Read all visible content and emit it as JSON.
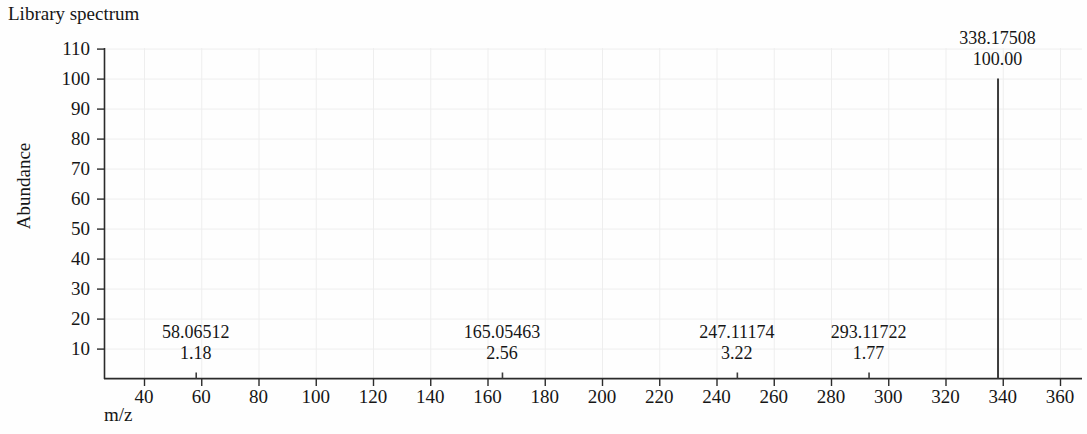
{
  "chart_title": "Library spectrum",
  "axes": {
    "y_label": "Abundance",
    "x_label": "m/z",
    "y_ticks": [
      110,
      100,
      90,
      80,
      70,
      60,
      50,
      40,
      30,
      20,
      10
    ],
    "x_ticks": [
      40,
      60,
      80,
      100,
      120,
      140,
      160,
      180,
      200,
      220,
      240,
      260,
      280,
      300,
      320,
      340,
      360
    ]
  },
  "chart_data": {
    "type": "bar",
    "title": "Library spectrum",
    "xlabel": "m/z",
    "ylabel": "Abundance",
    "xlim": [
      30,
      370
    ],
    "ylim": [
      0,
      112
    ],
    "grid": true,
    "legend": "none",
    "x": [
      58.06512,
      165.05463,
      247.11174,
      293.11722,
      338.17508
    ],
    "values": [
      1.18,
      2.56,
      3.22,
      1.77,
      100.0
    ],
    "labels": [
      {
        "mz": "58.06512",
        "abundance": "1.18"
      },
      {
        "mz": "165.05463",
        "abundance": "2.56"
      },
      {
        "mz": "247.11174",
        "abundance": "3.22"
      },
      {
        "mz": "293.11722",
        "abundance": "1.77"
      },
      {
        "mz": "338.17508",
        "abundance": "100.00"
      }
    ],
    "ytick_labels": [
      "110",
      "100",
      "90",
      "80",
      "70",
      "60",
      "50",
      "40",
      "30",
      "20",
      "10"
    ],
    "xtick_labels": [
      "40",
      "60",
      "80",
      "100",
      "120",
      "140",
      "160",
      "180",
      "200",
      "220",
      "240",
      "260",
      "280",
      "300",
      "320",
      "340",
      "360"
    ],
    "colors": {
      "peak": "#3c3c3c",
      "axis": "#2b2b2b",
      "grid": "#eeeeee",
      "text": "#161616"
    }
  }
}
